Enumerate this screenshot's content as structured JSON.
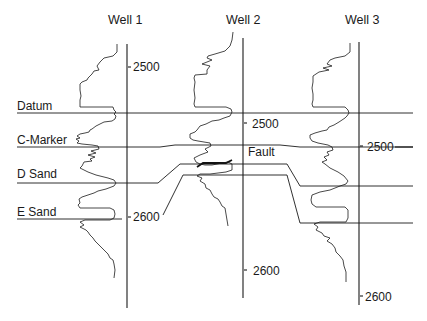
{
  "diagram": {
    "type": "well-log correlation cross-section",
    "wells": [
      {
        "name": "Well 1",
        "depth_ticks": [
          {
            "label": "2500"
          },
          {
            "label": "2600"
          }
        ]
      },
      {
        "name": "Well 2",
        "depth_ticks": [
          {
            "label": "2500"
          },
          {
            "label": "2600"
          }
        ]
      },
      {
        "name": "Well 3",
        "depth_ticks": [
          {
            "label": "2500"
          },
          {
            "label": "2600"
          }
        ]
      }
    ],
    "horizons": [
      {
        "name": "Datum"
      },
      {
        "name": "C-Marker"
      },
      {
        "name": "D Sand"
      },
      {
        "name": "E Sand"
      }
    ],
    "annotations": {
      "fault_label": "Fault"
    },
    "colors": {
      "line": "#1a1a1a",
      "background": "#ffffff"
    }
  }
}
